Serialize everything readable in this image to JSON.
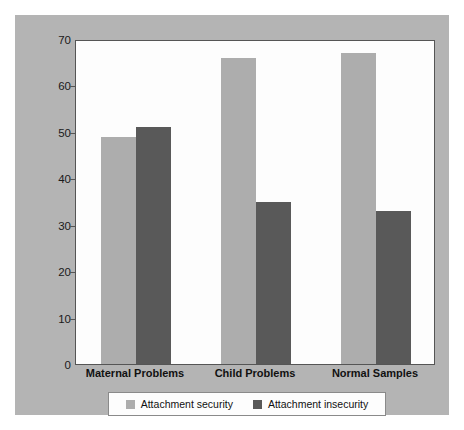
{
  "chart_data": {
    "type": "bar",
    "title": "",
    "xlabel": "",
    "ylabel": "Percentage of Infants",
    "categories": [
      "Maternal Problems",
      "Child Problems",
      "Normal Samples"
    ],
    "series": [
      {
        "name": "Attachment security",
        "color": "#adadad",
        "values": [
          49,
          66,
          67
        ]
      },
      {
        "name": "Attachment insecurity",
        "color": "#595959",
        "values": [
          51,
          35,
          33
        ]
      }
    ],
    "ylim": [
      0,
      70
    ],
    "yticks": [
      0,
      10,
      20,
      30,
      40,
      50,
      60,
      70
    ],
    "ytick_labels": [
      "0",
      "10",
      "20",
      "30",
      "40",
      "50",
      "60",
      "70"
    ],
    "grid": false,
    "legend_position": "bottom"
  },
  "figure": {
    "background_color": "#b4b4b4",
    "plot_background_color": "#fdfdfd",
    "axis_color": "#555555"
  },
  "legend": {
    "entries": [
      {
        "label": "Attachment security",
        "swatch": "security"
      },
      {
        "label": "Attachment insecurity",
        "swatch": "insecurity"
      }
    ]
  }
}
